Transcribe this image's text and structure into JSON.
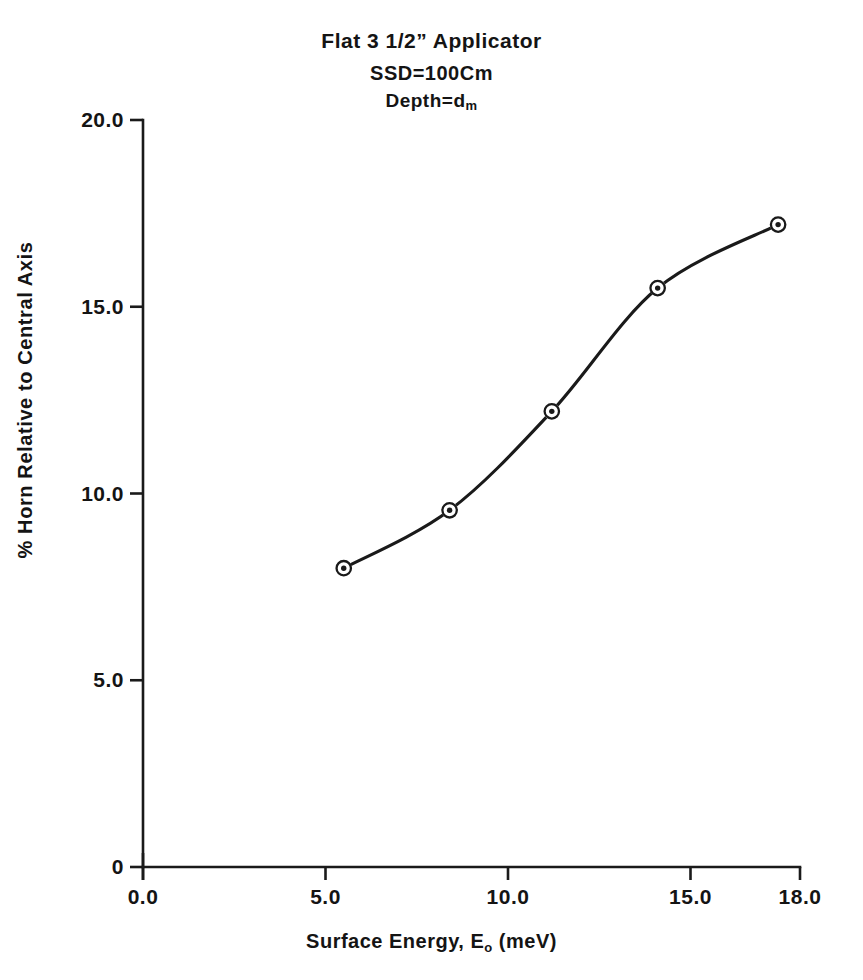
{
  "title": {
    "line1": "Flat 3 1/2” Applicator",
    "line2": "SSD=100Cm",
    "line3_main": "Depth=d",
    "line3_sub": "m"
  },
  "axes": {
    "ylabel": "% Horn Relative to Central Axis",
    "xlabel_main": "Surface Energy, E",
    "xlabel_sub": "o",
    "xlabel_unit": "(meV)"
  },
  "ghost_text": "",
  "chart_data": {
    "type": "line",
    "title": "Flat 3 1/2” Applicator  SSD=100Cm  Depth=dm",
    "xlabel": "Surface Energy, Eo (meV)",
    "ylabel": "% Horn Relative to Central Axis",
    "xlim": [
      0.0,
      18.0
    ],
    "ylim": [
      0.0,
      20.0
    ],
    "xticks": [
      0.0,
      5.0,
      10.0,
      15.0,
      18.0
    ],
    "xticklabels": [
      "0.0",
      "5.0",
      "10.0",
      "15.0",
      "18.0"
    ],
    "yticks": [
      0,
      5.0,
      10.0,
      15.0,
      20.0
    ],
    "yticklabels": [
      "0",
      "5.0",
      "10.0",
      "15.0",
      "20.0"
    ],
    "grid": false,
    "legend": false,
    "marker": "circle-with-center-dot",
    "line_color": "#1a1a1a",
    "series": [
      {
        "name": "% Horn vs Surface Energy",
        "x": [
          5.5,
          8.4,
          11.2,
          14.1,
          17.4
        ],
        "y": [
          8.0,
          9.55,
          12.2,
          15.5,
          17.2
        ]
      }
    ]
  }
}
